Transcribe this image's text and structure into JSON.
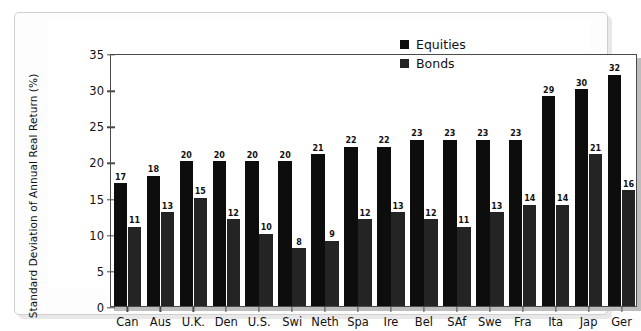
{
  "chart_data": {
    "type": "bar",
    "title": "",
    "xlabel": "",
    "ylabel": "Standard Deviation of Annual Real Return (%)",
    "ylim": [
      0,
      35
    ],
    "yticks": [
      0,
      5,
      10,
      15,
      20,
      25,
      30,
      35
    ],
    "grid": false,
    "legend_position": "top-right",
    "categories": [
      "Can",
      "Aus",
      "U.K.",
      "Den",
      "U.S.",
      "Swi",
      "Neth",
      "Spa",
      "Ire",
      "Bel",
      "SAf",
      "Swe",
      "Fra",
      "Ita",
      "Jap",
      "Ger"
    ],
    "series": [
      {
        "name": "Equities",
        "color": "#0d0d0d",
        "values": [
          17,
          18,
          20,
          20,
          20,
          20,
          21,
          22,
          22,
          23,
          23,
          23,
          23,
          29,
          30,
          32
        ]
      },
      {
        "name": "Bonds",
        "color": "#242424",
        "values": [
          11,
          13,
          15,
          12,
          10,
          8,
          9,
          12,
          13,
          12,
          11,
          13,
          14,
          14,
          21,
          16
        ]
      }
    ]
  },
  "legend": {
    "items": [
      {
        "label": "Equities",
        "color": "#0d0d0d"
      },
      {
        "label": "Bonds",
        "color": "#242424"
      }
    ]
  }
}
